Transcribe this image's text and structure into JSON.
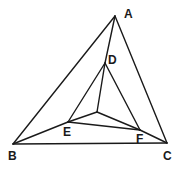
{
  "diagram": {
    "type": "geometry",
    "stroke_color": "#1a1a1a",
    "background": "#ffffff",
    "points": {
      "A": {
        "x": 115,
        "y": 16,
        "label": "A",
        "lx": 124,
        "ly": 18
      },
      "B": {
        "x": 13,
        "y": 144,
        "label": "B",
        "lx": 8,
        "ly": 160
      },
      "C": {
        "x": 167,
        "y": 143,
        "label": "C",
        "lx": 163,
        "ly": 160
      },
      "D": {
        "x": 105,
        "y": 63,
        "label": "D",
        "lx": 108,
        "ly": 64
      },
      "E": {
        "x": 68,
        "y": 122,
        "label": "E",
        "lx": 63,
        "ly": 136
      },
      "F": {
        "x": 140,
        "y": 130,
        "label": "F",
        "lx": 136,
        "ly": 143
      },
      "O": {
        "x": 97,
        "y": 112,
        "label": ""
      }
    },
    "edges": [
      [
        "A",
        "B"
      ],
      [
        "A",
        "C"
      ],
      [
        "B",
        "C"
      ],
      [
        "A",
        "D"
      ],
      [
        "B",
        "E"
      ],
      [
        "C",
        "F"
      ],
      [
        "D",
        "E"
      ],
      [
        "D",
        "F"
      ],
      [
        "E",
        "F"
      ],
      [
        "O",
        "D"
      ],
      [
        "O",
        "E"
      ],
      [
        "O",
        "F"
      ]
    ],
    "labels": [
      "A",
      "B",
      "C",
      "D",
      "E",
      "F"
    ]
  }
}
